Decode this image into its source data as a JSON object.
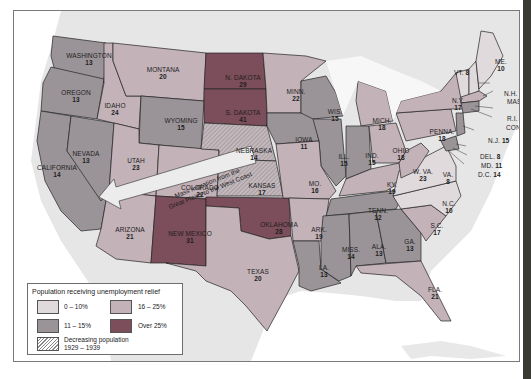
{
  "map": {
    "title": "Population receiving unemployment relief",
    "colors": {
      "band_0_10": "#e0dadd",
      "band_11_15": "#9a9498",
      "band_16_25": "#c3b2b8",
      "band_over_25": "#7c4d5a",
      "water": "#f4f4f4",
      "land_other": "#e4e4e4",
      "ocean": "#ffffff"
    },
    "annotation": {
      "line1": "Mass migration from the",
      "line2": "Great Plains to the West Coast"
    },
    "legend": {
      "title": "Population receiving unemployment relief",
      "items": [
        {
          "label": "0 – 10%",
          "color": "#e0dadd"
        },
        {
          "label": "16 – 25%",
          "color": "#c3b2b8"
        },
        {
          "label": "11 – 15%",
          "color": "#9a9498"
        },
        {
          "label": "Over 25%",
          "color": "#7c4d5a"
        },
        {
          "label_line1": "Decreasing population",
          "label_line2": "1929 – 1939",
          "pattern": "hatched"
        }
      ]
    },
    "states": [
      {
        "name": "WASHINGTON",
        "value": "13"
      },
      {
        "name": "OREGON",
        "value": "13"
      },
      {
        "name": "CALIFORNIA",
        "value": "14"
      },
      {
        "name": "NEVADA",
        "value": "13"
      },
      {
        "name": "IDAHO",
        "value": "24"
      },
      {
        "name": "MONTANA",
        "value": "20"
      },
      {
        "name": "WYOMING",
        "value": "15"
      },
      {
        "name": "UTAH",
        "value": "23"
      },
      {
        "name": "COLORADO",
        "value": "22"
      },
      {
        "name": "ARIZONA",
        "value": "21"
      },
      {
        "name": "NEW MEXICO",
        "value": "31"
      },
      {
        "name": "N. DAKOTA",
        "value": "29"
      },
      {
        "name": "S. DAKOTA",
        "value": "41"
      },
      {
        "name": "NEBRASKA",
        "value": "14"
      },
      {
        "name": "KANSAS",
        "value": "17"
      },
      {
        "name": "OKLAHOMA",
        "value": "28"
      },
      {
        "name": "TEXAS",
        "value": "20"
      },
      {
        "name": "MINN.",
        "value": "22"
      },
      {
        "name": "IOWA",
        "value": "11"
      },
      {
        "name": "MO.",
        "value": "16"
      },
      {
        "name": "ARK.",
        "value": "19"
      },
      {
        "name": "LA.",
        "value": "13"
      },
      {
        "name": "WIS.",
        "value": "15"
      },
      {
        "name": "ILL.",
        "value": "15"
      },
      {
        "name": "MICH.",
        "value": "18"
      },
      {
        "name": "IND.",
        "value": "15"
      },
      {
        "name": "OHIO",
        "value": "18"
      },
      {
        "name": "KY.",
        "value": "19"
      },
      {
        "name": "TENN.",
        "value": "12"
      },
      {
        "name": "MISS.",
        "value": "14"
      },
      {
        "name": "ALA.",
        "value": "13"
      },
      {
        "name": "GA.",
        "value": "13"
      },
      {
        "name": "FLA.",
        "value": "21"
      },
      {
        "name": "S.C.",
        "value": "17"
      },
      {
        "name": "N.C.",
        "value": "10"
      },
      {
        "name": "VA.",
        "value": "8"
      },
      {
        "name": "W. VA.",
        "value": "23"
      },
      {
        "name": "PENNA.",
        "value": "18"
      },
      {
        "name": "N.Y.",
        "value": "17"
      },
      {
        "name": "ME.",
        "value": "10"
      },
      {
        "name": "VT.",
        "value": "8"
      },
      {
        "name": "N.H.",
        "value": "9"
      },
      {
        "name": "MASS.",
        "value": "16"
      },
      {
        "name": "R.I.",
        "value": "11"
      },
      {
        "name": "CONN.",
        "value": "11"
      },
      {
        "name": "N.J.",
        "value": "15"
      },
      {
        "name": "DEL.",
        "value": "8"
      },
      {
        "name": "MD.",
        "value": "11"
      },
      {
        "name": "D.C.",
        "value": "14"
      }
    ]
  }
}
